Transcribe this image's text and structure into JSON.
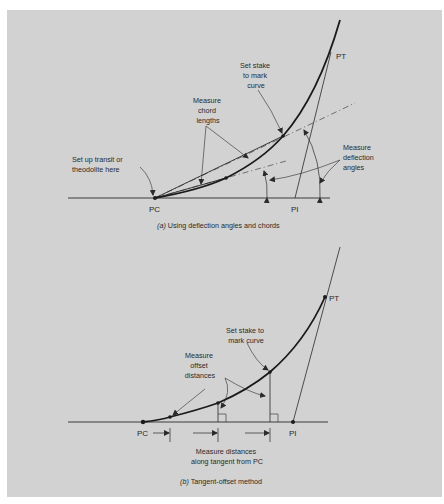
{
  "figure": {
    "background_color": "#d2d2d2",
    "ink_color": "#2a2a2a",
    "panel_a": {
      "caption_prefix": "(a)",
      "caption_text": " Using deflection angles and chords",
      "points": {
        "pc": "PC",
        "pi": "PI",
        "pt": "PT"
      },
      "annotations": {
        "setup_line1": "Set up transit or",
        "setup_line2": "theodolite here",
        "chord_line1": "Measure",
        "chord_line2": "chord",
        "chord_line3": "lengths",
        "stake_line1": "Set stake",
        "stake_line2": "to mark",
        "stake_line3": "curve",
        "deflect_line1": "Measure",
        "deflect_line2": "deflection",
        "deflect_line3": "angles"
      }
    },
    "panel_b": {
      "caption_prefix": "(b)",
      "caption_text": " Tangent-offset method",
      "points": {
        "pc": "PC",
        "pi": "PI",
        "pt": "PT"
      },
      "annotations": {
        "stake_line1": "Set stake to",
        "stake_line2": "mark curve",
        "offset_line1": "Measure",
        "offset_line2": "offset",
        "offset_line3": "distances",
        "along_line1": "Measure distances",
        "along_line2": "along tangent from PC"
      }
    }
  }
}
